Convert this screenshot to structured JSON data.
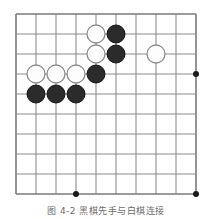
{
  "figure": {
    "kind": "go-board-diagram",
    "caption": "图 4-2 黑棋先手与白棋连接",
    "background_color": "#ffffff"
  },
  "board": {
    "columns": 10,
    "rows": 10,
    "origin_x": 16,
    "origin_y": 14,
    "spacing": 20,
    "line_color": "#8c8c8c",
    "line_width": 1.1,
    "edge_line_color": "#7a7a7a",
    "edge_line_width": 1.6,
    "star_point_color": "#1a1a1a",
    "star_point_radius": 3,
    "star_points": [
      {
        "col": 3,
        "row": 9
      },
      {
        "col": 9,
        "row": 3
      },
      {
        "col": 9,
        "row": 9
      }
    ]
  },
  "stones": {
    "radius": 9,
    "white_fill": "#fdfdfd",
    "white_stroke": "#8c8c8c",
    "black_fill": "#2b2b2b",
    "black_stroke": "#141414",
    "items": [
      {
        "col": 4,
        "row": 1,
        "color": "white"
      },
      {
        "col": 5,
        "row": 1,
        "color": "black"
      },
      {
        "col": 4,
        "row": 2,
        "color": "white"
      },
      {
        "col": 5,
        "row": 2,
        "color": "black"
      },
      {
        "col": 7,
        "row": 2,
        "color": "white"
      },
      {
        "col": 1,
        "row": 3,
        "color": "white"
      },
      {
        "col": 2,
        "row": 3,
        "color": "white"
      },
      {
        "col": 3,
        "row": 3,
        "color": "white"
      },
      {
        "col": 4,
        "row": 3,
        "color": "black"
      },
      {
        "col": 1,
        "row": 4,
        "color": "black"
      },
      {
        "col": 2,
        "row": 4,
        "color": "black"
      },
      {
        "col": 3,
        "row": 4,
        "color": "black"
      }
    ]
  }
}
